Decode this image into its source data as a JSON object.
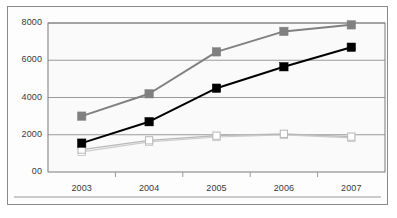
{
  "chart_data": {
    "type": "line",
    "title": "",
    "subtitle": "",
    "xlabel": "",
    "ylabel": "",
    "categories": [
      "2003",
      "2004",
      "2005",
      "2006",
      "2007"
    ],
    "ytick_labels": [
      "8000",
      "6000",
      "4000",
      "2000",
      "00"
    ],
    "ytick_values": [
      8000,
      6000,
      4000,
      2000,
      0
    ],
    "ylim": [
      0,
      8000
    ],
    "grid": "horizontal",
    "legend": "none",
    "series": [
      {
        "name": "series-1-gray",
        "color": "#808080",
        "marker": "filled-square",
        "marker_color": "#808080",
        "values": [
          3000,
          4200,
          6450,
          7550,
          7900
        ]
      },
      {
        "name": "series-2-black",
        "color": "#000000",
        "marker": "filled-square",
        "marker_color": "#000000",
        "values": [
          1550,
          2700,
          4500,
          5650,
          6700
        ]
      },
      {
        "name": "series-3-light-gray",
        "color": "#b8b8b8",
        "marker": "open-square",
        "marker_color": "#ffffff",
        "values": [
          1200,
          1700,
          1950,
          2050,
          1900
        ]
      },
      {
        "name": "series-4-pale-gray",
        "color": "#cccccc",
        "marker": "open-square",
        "marker_color": "#ffffff",
        "values": [
          1080,
          1620,
          1880,
          1990,
          1830
        ]
      }
    ]
  },
  "style": {
    "plot_background": "#fafafa",
    "grid_color": "#9a9a9a",
    "axis_color": "#7a7a7a",
    "frame_color": "#8a8a8a",
    "tick_text_color": "#3a3a3a"
  }
}
